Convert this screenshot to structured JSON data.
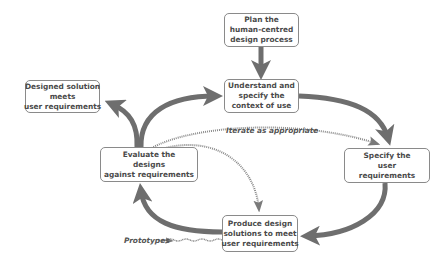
{
  "diagram": {
    "nodes": {
      "plan": {
        "lines": [
          "Plan the",
          "human-centred",
          "design process"
        ]
      },
      "understand": {
        "lines": [
          "Understand and",
          "specify the",
          "context of use"
        ]
      },
      "specify": {
        "lines": [
          "Specify the",
          "user",
          "requirements"
        ]
      },
      "produce": {
        "lines": [
          "Produce design",
          "solutions to meet",
          "user requirements"
        ]
      },
      "evaluate": {
        "lines": [
          "Evaluate the",
          "designs",
          "against requirements"
        ]
      },
      "designed": {
        "lines": [
          "Designed solution",
          "meets",
          "user requirements"
        ]
      }
    },
    "labels": {
      "iterate": "Iterate as appropriate",
      "prototypes": "Prototypes"
    },
    "edges": [
      {
        "from": "plan",
        "to": "understand",
        "style": "solid"
      },
      {
        "from": "understand",
        "to": "specify",
        "style": "solid"
      },
      {
        "from": "specify",
        "to": "produce",
        "style": "solid"
      },
      {
        "from": "produce",
        "to": "evaluate",
        "style": "solid"
      },
      {
        "from": "evaluate",
        "to": "understand",
        "style": "solid"
      },
      {
        "from": "evaluate",
        "to": "designed",
        "style": "solid"
      },
      {
        "from": "evaluate",
        "to": "specify",
        "style": "dotted",
        "label": "Iterate as appropriate"
      },
      {
        "from": "evaluate",
        "to": "produce",
        "style": "dotted"
      },
      {
        "from": "produce",
        "to": "prototypes",
        "style": "wavy"
      }
    ],
    "colors": {
      "arrow": "#6e6e6e",
      "box_border": "#8a8a8a",
      "text": "#4a4a4a"
    }
  }
}
